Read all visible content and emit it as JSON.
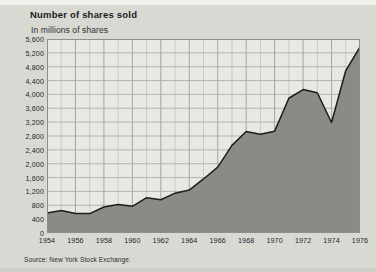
{
  "figure": {
    "title": "Number of shares sold",
    "subtitle": "In millions of shares",
    "source": "Source: New York Stock Exchange."
  },
  "colors": {
    "background": "#d9d9d4",
    "plot_background": "#e8e8e4",
    "area_fill": "#8a8a86",
    "line": "#1d1d1d",
    "grid": "#b2b2ad",
    "text": "#222222"
  },
  "chart_data": {
    "type": "area",
    "title": "Number of shares sold",
    "subtitle": "In millions of shares",
    "xlabel": "",
    "ylabel": "In millions of shares",
    "source": "Source: New York Stock Exchange.",
    "xlim": [
      1954,
      1976
    ],
    "ylim": [
      0,
      5600
    ],
    "grid": true,
    "legend": false,
    "x_tick_step": 2,
    "y_tick_step": 400,
    "xticks": [
      1954,
      1956,
      1958,
      1960,
      1962,
      1964,
      1966,
      1968,
      1970,
      1972,
      1974,
      1976
    ],
    "xtick_labels": [
      "1954",
      "1956",
      "1958",
      "1960",
      "1962",
      "1964",
      "1966",
      "1968",
      "1970",
      "1972",
      "1974",
      "1976"
    ],
    "yticks": [
      0,
      400,
      800,
      1200,
      1600,
      2000,
      2400,
      2800,
      3200,
      3600,
      4000,
      4400,
      4800,
      5200,
      5600
    ],
    "ytick_labels": [
      "0",
      "400",
      "800",
      "1,200",
      "1,600",
      "2,000",
      "2,400",
      "2,800",
      "3,200",
      "3,600",
      "4,000",
      "4,400",
      "4,800",
      "5,200",
      "5,600"
    ],
    "x": [
      1954,
      1955,
      1956,
      1957,
      1958,
      1959,
      1960,
      1961,
      1962,
      1963,
      1964,
      1965,
      1966,
      1967,
      1968,
      1969,
      1970,
      1971,
      1972,
      1973,
      1974,
      1975,
      1976
    ],
    "values": [
      575,
      650,
      560,
      560,
      750,
      820,
      770,
      1020,
      960,
      1150,
      1240,
      1560,
      1900,
      2530,
      2930,
      2850,
      2940,
      3890,
      4140,
      4050,
      3190,
      4690,
      5370
    ],
    "series": [
      {
        "name": "Number of shares sold",
        "values": [
          575,
          650,
          560,
          560,
          750,
          820,
          770,
          1020,
          960,
          1150,
          1240,
          1560,
          1900,
          2530,
          2930,
          2850,
          2940,
          3890,
          4140,
          4050,
          3190,
          4690,
          5370
        ]
      }
    ]
  }
}
